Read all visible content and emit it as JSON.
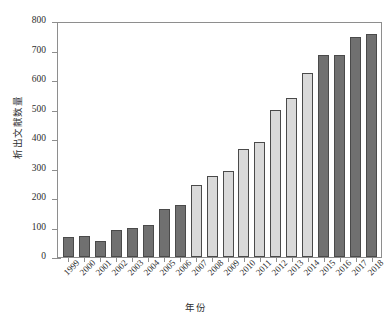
{
  "chart_data": {
    "type": "bar",
    "title": "",
    "xlabel": "年份",
    "ylabel": "析出文献数量",
    "categories": [
      "1999",
      "2000",
      "2001",
      "2002",
      "2003",
      "2004",
      "2005",
      "2006",
      "2007",
      "2008",
      "2009",
      "2010",
      "2011",
      "2012",
      "2013",
      "2014",
      "2015",
      "2016",
      "2017",
      "2018"
    ],
    "values": [
      68,
      72,
      55,
      90,
      100,
      108,
      163,
      175,
      245,
      275,
      290,
      365,
      390,
      500,
      540,
      625,
      685,
      685,
      745,
      755
    ],
    "bar_colors": [
      "#707070",
      "#707070",
      "#707070",
      "#707070",
      "#707070",
      "#707070",
      "#707070",
      "#707070",
      "#d9d9d9",
      "#d9d9d9",
      "#d9d9d9",
      "#d9d9d9",
      "#d9d9d9",
      "#d9d9d9",
      "#d9d9d9",
      "#d9d9d9",
      "#707070",
      "#707070",
      "#707070",
      "#707070"
    ],
    "ylim": [
      0,
      800
    ],
    "ytick_values": [
      0,
      100,
      200,
      300,
      400,
      500,
      600,
      700,
      800
    ],
    "ytick_labels": [
      "0",
      "100",
      "200",
      "300",
      "400",
      "500",
      "600",
      "700",
      "800"
    ],
    "grid": false,
    "legend": null,
    "legend_position": "none",
    "frame": true,
    "bar_edge_color": "#4a4a4a",
    "axis_color": "#8e8e8e",
    "background": "#ffffff"
  }
}
